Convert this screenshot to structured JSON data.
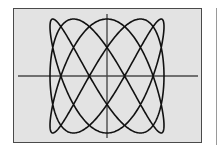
{
  "figure": {
    "frame": {
      "fill": "#e3e3e3",
      "border": "#4a4a4a"
    },
    "axis_color": "#4a4a4a",
    "curve_color": "#111111"
  },
  "chart_data": {
    "type": "line",
    "title": "",
    "xlabel": "",
    "ylabel": "",
    "grid": false,
    "legend": [],
    "parametric": {
      "x": "sin(3t)",
      "y": "cos(5t)",
      "freq_x": 3,
      "freq_y": 5,
      "phase_y": 1.5708,
      "t_range": [
        0,
        6.2832
      ]
    },
    "xlim": [
      -1,
      1
    ],
    "ylim": [
      -1,
      1
    ],
    "axis_crossings_x": [
      -0.809,
      -0.309,
      0.309,
      0.809
    ],
    "top_touch_x": [
      -0.951,
      -0.588,
      0,
      0.588,
      0.951
    ]
  },
  "layout": {
    "center": [
      107,
      76
    ],
    "radius_x": 57,
    "radius_y": 57,
    "h_axis": {
      "x1": 18,
      "x2": 198,
      "y": 76
    },
    "v_axis": {
      "x": 107,
      "y1": 14,
      "y2": 138
    }
  }
}
